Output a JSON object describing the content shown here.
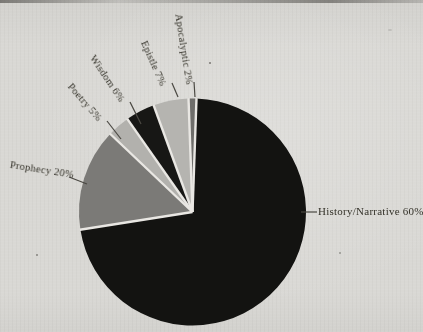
{
  "page": {
    "background": "#d9d8d4",
    "description_text": ""
  },
  "chart_data": {
    "type": "pie",
    "categories": [
      "History/Narrative",
      "Prophecy",
      "Poetry",
      "Wisdom",
      "Epistle",
      "Apocalyptic"
    ],
    "values": [
      60,
      20,
      5,
      6,
      7,
      2
    ],
    "unit": "%",
    "legend_position": "none",
    "grid": false,
    "slices": [
      {
        "label": "History/Narrative",
        "value": 60,
        "display_label": "History/Narrative 60%",
        "color": "#131311"
      },
      {
        "label": "Prophecy",
        "value": 20,
        "display_label": "Prophecy 20%",
        "color": "#7b7a77"
      },
      {
        "label": "Poetry",
        "value": 5,
        "display_label": "Poetry 5%",
        "color": "#b2b1ad"
      },
      {
        "label": "Wisdom",
        "value": 6,
        "display_label": "Wisdom 6%",
        "color": "#171715"
      },
      {
        "label": "Epistle",
        "value": 7,
        "display_label": "Epistle 7%",
        "color": "#b5b4b0"
      },
      {
        "label": "Apocalyptic",
        "value": 2,
        "display_label": "Apocalyptic 2%",
        "color": "#6e6d6a"
      }
    ],
    "layout": {
      "center_x": 192.5,
      "center_y": 212,
      "radius": 113.5,
      "clockwise": true,
      "display_boundaries_deg": [
        2,
        261,
        313.5,
        325,
        340,
        358,
        362
      ],
      "slice_gap_color": "#e9e7e3",
      "slice_gap_width": 2.4,
      "leader_color": "#4a4842",
      "labels": [
        {
          "x": 318,
          "y": 205,
          "rotate": 0,
          "big": true,
          "leader": [
            301,
            212,
            317,
            212
          ]
        },
        {
          "x": 11,
          "y": 159,
          "rotate": 9,
          "big": false,
          "leader": [
            69,
            177,
            87,
            184
          ]
        },
        {
          "x": 74,
          "y": 81,
          "rotate": 49,
          "big": false,
          "leader": [
            107,
            121,
            121,
            139
          ]
        },
        {
          "x": 97,
          "y": 53,
          "rotate": 56,
          "big": false,
          "leader": [
            130,
            102,
            141,
            124
          ]
        },
        {
          "x": 149,
          "y": 39,
          "rotate": 66,
          "big": false,
          "leader": [
            172,
            83,
            178,
            97
          ]
        },
        {
          "x": 184,
          "y": 13,
          "rotate": 81,
          "big": false,
          "leader": [
            194,
            82,
            195,
            97
          ]
        }
      ]
    }
  }
}
